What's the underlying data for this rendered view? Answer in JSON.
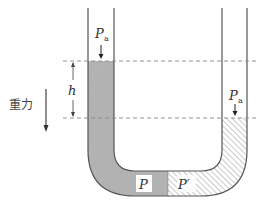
{
  "diagram": {
    "labels": {
      "atm_left": "P",
      "atm_left_sub": "a",
      "atm_right": "P",
      "atm_right_sub": "a",
      "height": "h",
      "gravity": "重力",
      "pressure_left": "P",
      "pressure_right": "P′"
    },
    "colors": {
      "tube_wall": "#555555",
      "fluid_left_fill": "#b3b3b3",
      "hatch": "#777777",
      "dashed": "#888888",
      "text": "#333333"
    }
  }
}
